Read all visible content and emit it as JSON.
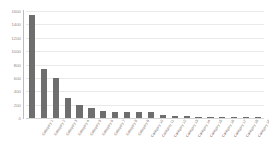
{
  "chart_data": {
    "type": "bar",
    "title": "",
    "subtitle": "",
    "xlabel": "",
    "ylabel": "",
    "ylim": [
      0,
      1600
    ],
    "ytick_step": 200,
    "ytick_labels": [
      "1600",
      "1400",
      "1200",
      "1000",
      "800",
      "600",
      "400",
      "200",
      "0"
    ],
    "ytick_values": [
      1600,
      1400,
      1200,
      1000,
      800,
      600,
      400,
      200,
      0
    ],
    "grid": true,
    "grid_axis": "y",
    "legend": false,
    "legend_position": "none",
    "orientation": "vertical",
    "sorted": "descending",
    "bar_color": "#6e6e6e",
    "background_color": "#ffffff",
    "gridline_color": "#e9e9e9",
    "axis_color": "#bdbdbd",
    "tick_label_color": "#8a8a8a",
    "xtick_rotation": -58,
    "xtick_labels_legible": false,
    "categories": [
      "Category 1",
      "Category 2",
      "Category 3",
      "Category 4",
      "Category 5",
      "Category 6",
      "Category 7",
      "Category 8",
      "Category 9",
      "Category 10",
      "Category 11",
      "Category 12",
      "Category 13",
      "Category 14",
      "Category 15",
      "Category 16",
      "Category 17",
      "Category 18",
      "Category 19",
      "Category 20"
    ],
    "values": [
      1540,
      735,
      600,
      295,
      195,
      150,
      105,
      95,
      90,
      88,
      85,
      50,
      30,
      25,
      22,
      20,
      18,
      15,
      12,
      8
    ]
  }
}
